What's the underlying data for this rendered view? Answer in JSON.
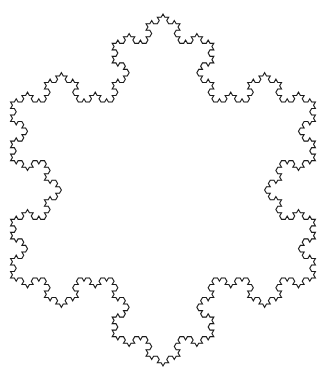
{
  "figure": {
    "type": "koch-snowflake",
    "iterations": 4,
    "center": [
      163,
      190
    ],
    "radius": 176,
    "rotation_deg": -90,
    "stroke_color": "#1a1a1a",
    "stroke_width": 1.1,
    "background": "#ffffff"
  }
}
